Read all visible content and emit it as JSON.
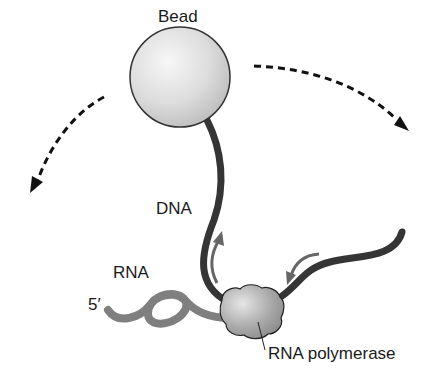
{
  "diagram": {
    "labels": {
      "bead": "Bead",
      "dna": "DNA",
      "rna": "RNA",
      "five_prime": "5′",
      "rna_polymerase": "RNA polymerase"
    },
    "elements": [
      {
        "name": "bead",
        "shape": "sphere",
        "color": "#e0e0e0"
      },
      {
        "name": "dna-strand",
        "color": "#3a3a3a"
      },
      {
        "name": "rna-strand",
        "color": "#808080"
      },
      {
        "name": "rna-polymerase",
        "color": "#a8a8a8"
      },
      {
        "name": "rotation-arrow-left",
        "style": "dashed"
      },
      {
        "name": "rotation-arrow-right",
        "style": "dashed"
      },
      {
        "name": "dna-movement-arrows",
        "color": "#6a6a6a"
      }
    ]
  }
}
